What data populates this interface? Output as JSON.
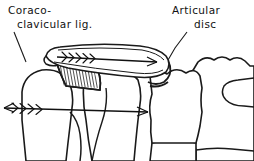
{
  "figure": {
    "background_color": "#ffffff",
    "ink_color": "#1a1a1a",
    "width": 254,
    "height": 161
  },
  "labels": {
    "coracoclavicular": {
      "line1": "Coraco-",
      "line2": "clavicular lig.",
      "name": "coracoclavicular-ligament-label"
    },
    "articular_disc": {
      "line1": "Articular",
      "line2": "disc",
      "name": "articular-disc-label"
    }
  },
  "structures": [
    {
      "id": "clavicle",
      "label": "clavicle"
    },
    {
      "id": "coracoid-process",
      "label": "coracoid process"
    },
    {
      "id": "coracoclavicular-ligament",
      "label": "coracoclavicular ligament"
    },
    {
      "id": "articular-disc",
      "label": "articular disc"
    },
    {
      "id": "scapula-body",
      "label": "scapula body"
    },
    {
      "id": "humeral-head",
      "label": "humeral head"
    },
    {
      "id": "sternum-manubrium",
      "label": "manubrium of sternum"
    },
    {
      "id": "first-rib",
      "label": "first rib"
    }
  ],
  "annotations": {
    "clavicle_force_arrow": "force vector along clavicle directed medially",
    "lower_force_arrow": "double-headed force vector across joint"
  }
}
